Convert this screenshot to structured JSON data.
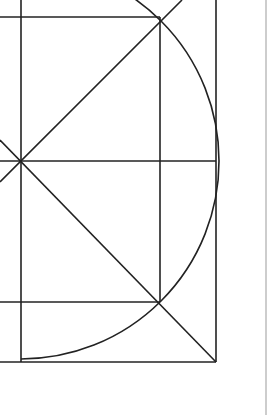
{
  "diagram": {
    "type": "geometric-construction",
    "colors": {
      "background": "#ffffff",
      "stroke": "#222222",
      "edge_line": "#bdbdbd"
    },
    "center": {
      "x": 21,
      "y": 161
    },
    "radius": 198,
    "lines": [
      {
        "name": "left-vertical",
        "x1": 21,
        "y1": 0,
        "x2": 21,
        "y2": 362
      },
      {
        "name": "top-horizontal",
        "x1": 0,
        "y1": 17,
        "x2": 160,
        "y2": 17
      },
      {
        "name": "middle-horizontal",
        "x1": 0,
        "y1": 161,
        "x2": 216,
        "y2": 161
      },
      {
        "name": "lower-horizontal",
        "x1": 0,
        "y1": 302,
        "x2": 160,
        "y2": 302
      },
      {
        "name": "bottom-horizontal",
        "x1": 0,
        "y1": 362,
        "x2": 216,
        "y2": 362
      },
      {
        "name": "right-vertical",
        "x1": 216,
        "y1": 0,
        "x2": 216,
        "y2": 362
      },
      {
        "name": "inner-vertical",
        "x1": 160,
        "y1": 17,
        "x2": 160,
        "y2": 302
      },
      {
        "name": "diagonal-up",
        "x1": 0,
        "y1": 182,
        "x2": 182,
        "y2": 0
      },
      {
        "name": "diagonal-down",
        "x1": 0,
        "y1": 140,
        "x2": 216,
        "y2": 362
      }
    ],
    "edge_line": {
      "x": 266,
      "y1": 0,
      "y2": 415
    }
  }
}
